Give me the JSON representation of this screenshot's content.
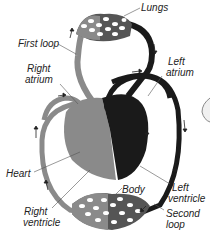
{
  "diagram": {
    "colors": {
      "deoxygenated": "#8a8a8a",
      "oxygenated": "#1a1a1a",
      "background": "#ffffff",
      "leader_line": "#555555"
    },
    "labels": {
      "lungs": "Lungs",
      "first_loop": "First loop",
      "right_atrium_1": "Right",
      "right_atrium_2": "atrium",
      "left_atrium_1": "Left",
      "left_atrium_2": "atrium",
      "heart": "Heart",
      "body": "Body",
      "left_ventricle_1": "Left",
      "left_ventricle_2": "ventricle",
      "right_ventricle_1": "Right",
      "right_ventricle_2": "ventricle",
      "second_loop_1": "Second",
      "second_loop_2": "loop"
    }
  }
}
